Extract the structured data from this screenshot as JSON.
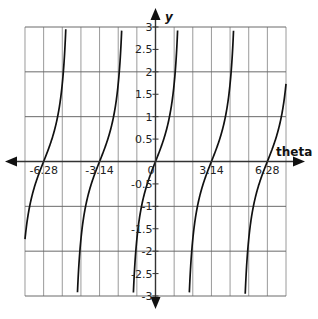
{
  "chart_data": {
    "type": "line",
    "title": "",
    "function": "tan(theta)",
    "xlabel": "theta",
    "ylabel": "y",
    "xlim": [
      -7.33,
      7.33
    ],
    "ylim": [
      -3,
      3
    ],
    "x_grid_step": 1.0472,
    "y_grid_step": 1,
    "y_tick_step": 0.5,
    "grid": true,
    "x_tick_labels": [
      {
        "value": -6.28,
        "label": "-6.28"
      },
      {
        "value": -3.14,
        "label": "-3.14"
      },
      {
        "value": 0,
        "label": "0"
      },
      {
        "value": 3.14,
        "label": "3.14"
      },
      {
        "value": 6.28,
        "label": "6.28"
      }
    ],
    "y_tick_labels": [
      {
        "value": 3,
        "label": "3"
      },
      {
        "value": 2.5,
        "label": "2.5"
      },
      {
        "value": 2,
        "label": "2"
      },
      {
        "value": 1.5,
        "label": "1.5"
      },
      {
        "value": 1,
        "label": "1"
      },
      {
        "value": 0.5,
        "label": "0.5"
      },
      {
        "value": -0.5,
        "label": "-0.5"
      },
      {
        "value": -1,
        "label": "-1"
      },
      {
        "value": -1.5,
        "label": "-1.5"
      },
      {
        "value": -2,
        "label": "-2"
      },
      {
        "value": -2.5,
        "label": "-2.5"
      },
      {
        "value": -3,
        "label": "-3"
      }
    ],
    "series": [
      {
        "name": "tan(theta)",
        "color": "#111111",
        "asymptotes": [
          -4.712,
          -1.571,
          1.571,
          4.712
        ]
      }
    ]
  },
  "colors": {
    "grid": "#9a9a9a",
    "axis": "#333333",
    "curve": "#111111"
  }
}
